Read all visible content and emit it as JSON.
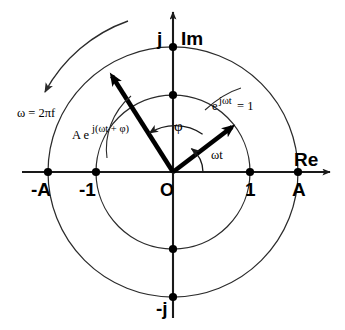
{
  "figure": {
    "axes": {
      "real_label": "Re",
      "imag_label": "Im",
      "origin_label": "O"
    },
    "tick_labels": {
      "neg_amplitude": "-A",
      "neg_one": "-1",
      "one": "1",
      "amplitude": "A",
      "pos_j": "j",
      "neg_j": "-j"
    },
    "annotations": {
      "angular_frequency": "ω = 2πf",
      "phasor_expression": "A e j(ωt + φ)",
      "phasor_expression_base": "A e",
      "phasor_expression_exponent": "j(ωt + φ)",
      "unit_phasor": "e jωt = 1",
      "unit_phasor_base": "e",
      "unit_phasor_exponent": "jωt",
      "unit_phasor_value": "= 1",
      "phase_angle": "φ",
      "rotation_angle": "ωt"
    },
    "geometry": {
      "center_x": 173,
      "center_y": 172,
      "inner_radius": 77,
      "outer_radius": 125,
      "phasor_angle_deg": 120,
      "unit_vector_angle_deg": 52
    },
    "colors": {
      "stroke": "#000000",
      "circle": "#2b2b2b",
      "background": "#ffffff"
    }
  }
}
